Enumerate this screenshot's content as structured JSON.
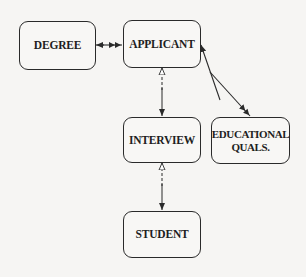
{
  "diagram": {
    "type": "entity-relationship",
    "nodes": [
      {
        "id": "degree",
        "label": "DEGREE"
      },
      {
        "id": "applicant",
        "label": "APPLICANT"
      },
      {
        "id": "interview",
        "label": "INTERVIEW"
      },
      {
        "id": "educational_quals",
        "label_line1": "EDUCATIONAL",
        "label_line2": "QUALS."
      },
      {
        "id": "student",
        "label": "STUDENT"
      }
    ],
    "edges": [
      {
        "from": "degree",
        "to": "applicant",
        "style": "solid",
        "from_end": "single-arrow",
        "to_end": "double-arrow"
      },
      {
        "from": "applicant",
        "to": "educational_quals",
        "style": "solid",
        "from_end": "single-arrow",
        "to_end": "double-arrow"
      },
      {
        "from": "applicant",
        "to": "interview",
        "style": "dashed",
        "from_end": "open-arrow",
        "to_end": "single-arrow"
      },
      {
        "from": "interview",
        "to": "student",
        "style": "dashed",
        "from_end": "open-arrow",
        "to_end": "single-arrow"
      }
    ],
    "colors": {
      "line": "#2a2a2a",
      "background": "#f6f5f3"
    }
  }
}
